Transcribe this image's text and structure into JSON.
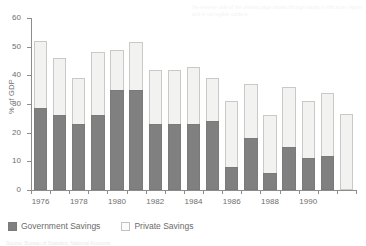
{
  "chart_data": {
    "type": "bar",
    "stacked": true,
    "title": "",
    "subtitle": "",
    "xlabel": "",
    "ylabel": "% of GDP",
    "ylim": [
      0,
      60
    ],
    "ytick_values": [
      0,
      10,
      20,
      30,
      40,
      50,
      60
    ],
    "ytick_labels": [
      "0",
      "10",
      "20",
      "30",
      "40",
      "50",
      "60"
    ],
    "grid": false,
    "legend_position": "bottom-left",
    "categories": [
      "1976",
      "1977",
      "1978",
      "1979",
      "1980",
      "1981",
      "1982",
      "1983",
      "1984",
      "1985",
      "1986",
      "1987",
      "1988",
      "1989",
      "1990",
      "1991",
      "1992"
    ],
    "xtick_labels": [
      "1976",
      "",
      "1978",
      "",
      "1980",
      "",
      "1982",
      "",
      "1984",
      "",
      "1986",
      "",
      "1988",
      "",
      "1990",
      "",
      ""
    ],
    "series": [
      {
        "name": "Government Savings",
        "color": "#808080",
        "values": [
          28.5,
          26.0,
          23.0,
          26.0,
          35.0,
          35.0,
          23.0,
          23.0,
          23.0,
          24.0,
          8.0,
          18.0,
          6.0,
          15.0,
          11.0,
          12.0,
          0.0
        ]
      },
      {
        "name": "Private Savings",
        "color": "#f2f2f0",
        "values": [
          23.5,
          20.0,
          16.0,
          22.0,
          14.0,
          16.5,
          19.0,
          19.0,
          20.0,
          15.0,
          23.0,
          19.0,
          20.0,
          21.0,
          20.0,
          22.0,
          26.5
        ]
      }
    ],
    "totals": [
      52.0,
      46.0,
      39.0,
      48.0,
      49.0,
      51.5,
      42.0,
      42.0,
      43.0,
      39.0,
      31.0,
      37.0,
      26.0,
      36.0,
      31.0,
      34.0,
      26.5
    ]
  },
  "legend": {
    "items": [
      {
        "label": "Government Savings",
        "swatch": "gov-swatch"
      },
      {
        "label": "Private Savings",
        "swatch": "private-swatch"
      }
    ]
  },
  "axis": {
    "y_title": "% of GDP"
  },
  "footer": {
    "source_text": "Source: Bureau of Statistics, National Accounts"
  },
  "bleed_text": "the reverse side of the printed page shows through faintly in this scan region and is not legible content"
}
